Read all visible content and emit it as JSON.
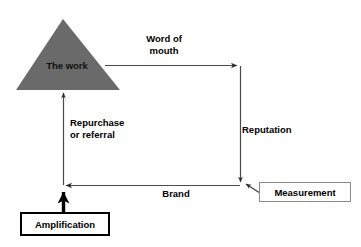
{
  "diagram": {
    "background_color": "#ffffff",
    "triangle": {
      "label": "The work",
      "fill_color": "#6a6a6a",
      "text_color": "#111111"
    },
    "edges": [
      {
        "name": "word-of-mouth",
        "label_line1": "Word of",
        "label_line2": "mouth",
        "direction": "right"
      },
      {
        "name": "reputation",
        "label": "Reputation",
        "direction": "down"
      },
      {
        "name": "brand",
        "label": "Brand",
        "direction": "left"
      },
      {
        "name": "repurchase-or-referral",
        "label_line1": "Repurchase",
        "label_line2": "or referral",
        "direction": "up"
      }
    ],
    "boxes": [
      {
        "name": "amplification",
        "label": "Amplification",
        "border_color": "#000000"
      },
      {
        "name": "measurement",
        "label": "Measurement",
        "border_color": "#8a8a8a"
      }
    ],
    "labels": {
      "the_work": "The work",
      "word_of_mouth_line1": "Word of",
      "word_of_mouth_line2": "mouth",
      "repurchase_line1": "Repurchase",
      "repurchase_line2": "or referral",
      "reputation": "Reputation",
      "brand": "Brand",
      "amplification": "Amplification",
      "measurement": "Measurement"
    },
    "colors": {
      "triangle_gray": "#6a6a6a",
      "line_gray": "#4a4a4a",
      "thick_black": "#000000",
      "measurement_border": "#8a8a8a"
    }
  }
}
